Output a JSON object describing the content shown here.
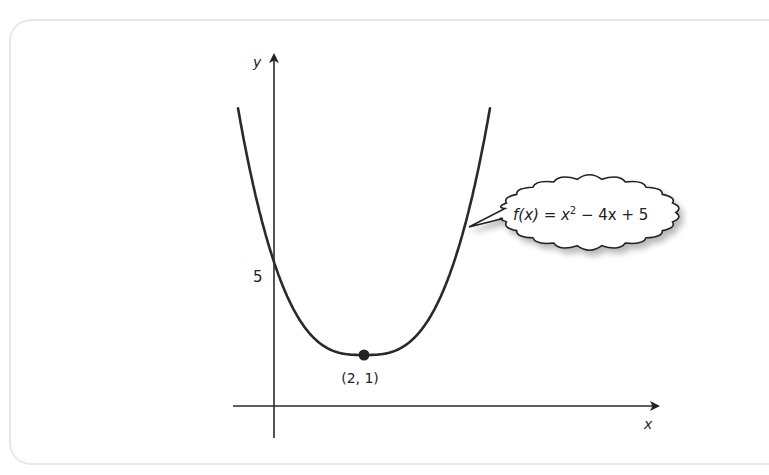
{
  "chart_data": {
    "type": "line",
    "title": "",
    "function_label": {
      "prefix": "f(x) = x",
      "exponent": "2",
      "suffix": " − 4x + 5"
    },
    "xlabel": "x",
    "ylabel": "y",
    "y_tick_labels": [
      "5"
    ],
    "series": [
      {
        "name": "f(x) = x^2 - 4x + 5",
        "equation": {
          "a": 1,
          "b": -4,
          "c": 5
        },
        "x_range": [
          -0.8,
          4.8
        ]
      }
    ],
    "points": [
      {
        "name": "vertex",
        "x": 2,
        "y": 1,
        "label": "(2, 1)"
      },
      {
        "name": "y-intercept",
        "x": 0,
        "y": 5,
        "label": "5"
      }
    ],
    "grid": false,
    "legend": "callout bubble at right"
  },
  "colors": {
    "curve": "#2a2a2a",
    "axis": "#2a2a2a",
    "frame_border": "#e8e8e8",
    "bubble_fill": "#ffffff",
    "bubble_stroke": "#222222"
  }
}
